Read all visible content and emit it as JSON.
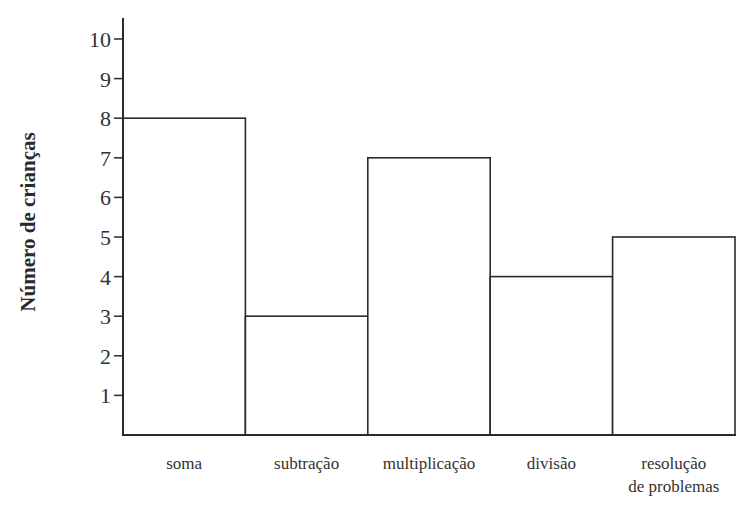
{
  "chart_data": {
    "type": "bar",
    "title": "",
    "xlabel": "",
    "ylabel": "Número de crianças",
    "categories": [
      "soma",
      "subtração",
      "multiplicação",
      "divisão",
      "resolução de problemas"
    ],
    "category_label_lines": [
      [
        "soma"
      ],
      [
        "subtração"
      ],
      [
        "multiplicação"
      ],
      [
        "divisão"
      ],
      [
        "resolução",
        "de problemas"
      ]
    ],
    "values": [
      8,
      3,
      7,
      4,
      5
    ],
    "ylim": [
      0,
      10
    ],
    "yticks": [
      1,
      2,
      3,
      4,
      5,
      6,
      7,
      8,
      9,
      10
    ],
    "grid": false,
    "legend": null,
    "bar_fill": "#ffffff",
    "bar_stroke": "#2a2a2a",
    "bar_gap": 0
  }
}
